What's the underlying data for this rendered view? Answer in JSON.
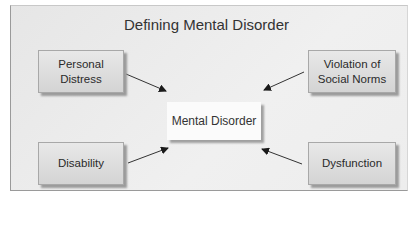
{
  "diagram": {
    "title": "Defining Mental Disorder",
    "center": {
      "label": "Mental Disorder"
    },
    "nodes": [
      {
        "id": "personal-distress",
        "label": "Personal Distress",
        "position": "top-left"
      },
      {
        "id": "violation-of-social-norms",
        "label": "Violation of Social Norms",
        "position": "top-right"
      },
      {
        "id": "disability",
        "label": "Disability",
        "position": "bottom-left"
      },
      {
        "id": "dysfunction",
        "label": "Dysfunction",
        "position": "bottom-right"
      }
    ],
    "edges": [
      {
        "from": "personal-distress",
        "to": "mental-disorder"
      },
      {
        "from": "violation-of-social-norms",
        "to": "mental-disorder"
      },
      {
        "from": "disability",
        "to": "mental-disorder"
      },
      {
        "from": "dysfunction",
        "to": "mental-disorder"
      }
    ]
  }
}
